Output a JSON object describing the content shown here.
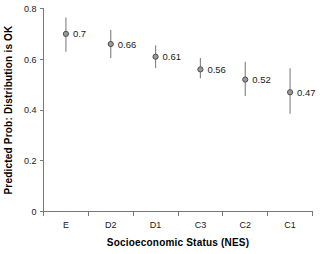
{
  "chart_data": {
    "type": "scatter",
    "title": "",
    "xlabel": "Socioeconomic Status (NES)",
    "ylabel": "Predicted Prob: Distribution is OK",
    "categories": [
      "E",
      "D2",
      "D1",
      "C3",
      "C2",
      "C1"
    ],
    "values": [
      0.7,
      0.66,
      0.61,
      0.56,
      0.52,
      0.47
    ],
    "point_labels": [
      "0.7",
      "0.66",
      "0.61",
      "0.56",
      "0.52",
      "0.47"
    ],
    "error_low": [
      0.63,
      0.605,
      0.565,
      0.525,
      0.455,
      0.385
    ],
    "error_high": [
      0.765,
      0.715,
      0.655,
      0.605,
      0.59,
      0.565
    ],
    "ylim": [
      0,
      0.8
    ],
    "yticks": [
      0,
      0.2,
      0.4,
      0.6,
      0.8
    ],
    "ytick_labels": [
      "0",
      "0.2",
      "0.4",
      "0.6",
      "0.8"
    ],
    "grid": false,
    "legend": "none",
    "marker_fill": "#9a9a9a",
    "marker_stroke": "#4d4d4d",
    "errorbar_color": "#8a8a8a",
    "axis_color": "#777777",
    "text_color": "#1a1a1a",
    "background": "#ffffff"
  }
}
